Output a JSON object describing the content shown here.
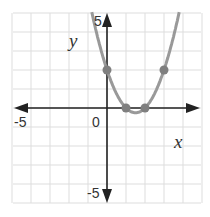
{
  "chart_data": {
    "type": "line",
    "title": "",
    "xlabel": "x",
    "ylabel": "y",
    "xlim": [
      -5,
      5
    ],
    "ylim": [
      -5,
      5
    ],
    "grid": true,
    "tick_labels": {
      "x_min": "-5",
      "origin": "0",
      "y_max": "5",
      "y_min": "-5"
    },
    "function": "y = x^2 - 3x + 2",
    "curve_color": "#999999",
    "axis_color": "#222222",
    "grid_color": "#dddddd",
    "series": [
      {
        "name": "parabola",
        "x": [
          -0.9,
          -0.5,
          0,
          0.5,
          1,
          1.5,
          2,
          2.5,
          3,
          3.5,
          3.9
        ],
        "y": [
          5.51,
          3.75,
          2,
          0.75,
          0,
          -0.25,
          0,
          0.75,
          2,
          3.75,
          5.51
        ]
      }
    ],
    "points": [
      {
        "x": 0,
        "y": 2
      },
      {
        "x": 1,
        "y": 0
      },
      {
        "x": 2,
        "y": 0
      },
      {
        "x": 3,
        "y": 2
      }
    ]
  }
}
